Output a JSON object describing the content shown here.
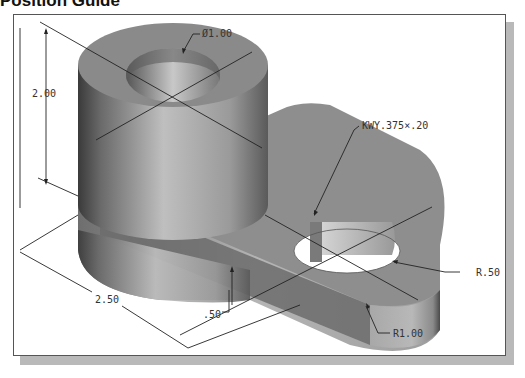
{
  "heading": "Position Guide",
  "figure": {
    "type": "isometric-part-drawing",
    "dimensions": {
      "hole_diameter": "Ø1.00",
      "height": "2.00",
      "length": "2.50",
      "base_thickness": ".50",
      "keyway": "KWY.375×.20",
      "small_hole_radius": "R.50",
      "outer_radius": "R1.00"
    },
    "colors": {
      "part_top": "#8f8f8f",
      "part_side_light": "#bdbdbd",
      "part_side_dark": "#4a4a4a",
      "dimension_line": "#222222",
      "frame_shadow": "#b9b9b9"
    }
  }
}
